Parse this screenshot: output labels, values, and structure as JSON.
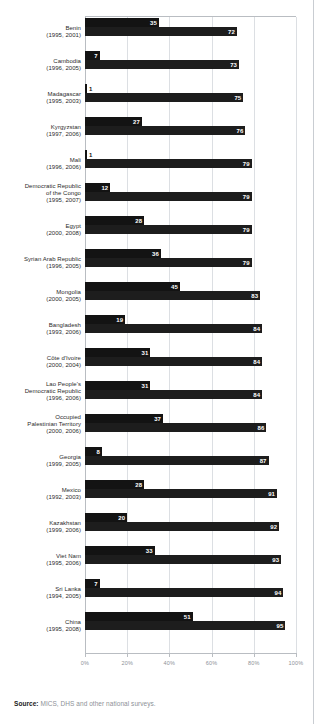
{
  "axis": {
    "ticks": [
      "0%",
      "20%",
      "40%",
      "60%",
      "80%",
      "100%"
    ],
    "tickvalues": [
      0,
      20,
      40,
      60,
      80,
      100
    ]
  },
  "source": {
    "label": "Source:",
    "text": "MICS, DHS and other national surveys."
  },
  "chart_data": {
    "type": "bar",
    "orientation": "horizontal",
    "title": "",
    "xlabel": "",
    "ylabel": "",
    "xlim": [
      0,
      100
    ],
    "grid": true,
    "legend": "none",
    "categories": [
      "Benin",
      "Cambodia",
      "Madagascar",
      "Kyrgyzstan",
      "Mali",
      "Democratic Republic of the Congo",
      "Egypt",
      "Syrian Arab Republic",
      "Mongolia",
      "Bangladesh",
      "Côte d'Ivoire",
      "Lao People's Democratic Republic",
      "Occupied Palestinian Territory",
      "Georgia",
      "Mexico",
      "Kazakhstan",
      "Viet Nam",
      "Sri Lanka",
      "China"
    ],
    "rows": [
      {
        "name": "Benin",
        "name_lines": [
          "Benin"
        ],
        "years": "(1995, 2001)",
        "earlier": 35,
        "later": 72
      },
      {
        "name": "Cambodia",
        "name_lines": [
          "Cambodia"
        ],
        "years": "(1996, 2005)",
        "earlier": 7,
        "later": 73
      },
      {
        "name": "Madagascar",
        "name_lines": [
          "Madagascar"
        ],
        "years": "(1995, 2003)",
        "earlier": 1,
        "later": 75
      },
      {
        "name": "Kyrgyzstan",
        "name_lines": [
          "Kyrgyzstan"
        ],
        "years": "(1997, 2006)",
        "earlier": 27,
        "later": 76
      },
      {
        "name": "Mali",
        "name_lines": [
          "Mali"
        ],
        "years": "(1996, 2006)",
        "earlier": 1,
        "later": 79
      },
      {
        "name": "Democratic Republic of the Congo",
        "name_lines": [
          "Democratic Republic",
          "of the Congo"
        ],
        "years": "(1995, 2007)",
        "earlier": 12,
        "later": 79
      },
      {
        "name": "Egypt",
        "name_lines": [
          "Egypt"
        ],
        "years": "(2000, 2008)",
        "earlier": 28,
        "later": 79
      },
      {
        "name": "Syrian Arab Republic",
        "name_lines": [
          "Syrian Arab Republic"
        ],
        "years": "(1996, 2005)",
        "earlier": 36,
        "later": 79
      },
      {
        "name": "Mongolia",
        "name_lines": [
          "Mongolia"
        ],
        "years": "(2000, 2005)",
        "earlier": 45,
        "later": 83
      },
      {
        "name": "Bangladesh",
        "name_lines": [
          "Bangladesh"
        ],
        "years": "(1993, 2006)",
        "earlier": 19,
        "later": 84
      },
      {
        "name": "Côte d'Ivoire",
        "name_lines": [
          "Côte d'Ivoire"
        ],
        "years": "(2000, 2004)",
        "earlier": 31,
        "later": 84
      },
      {
        "name": "Lao People's Democratic Republic",
        "name_lines": [
          "Lao People's",
          "Democratic Republic"
        ],
        "years": "(1996, 2006)",
        "earlier": 31,
        "later": 84
      },
      {
        "name": "Occupied Palestinian Territory",
        "name_lines": [
          "Occupied",
          "Palestinian Territory"
        ],
        "years": "(2000, 2006)",
        "earlier": 37,
        "later": 86
      },
      {
        "name": "Georgia",
        "name_lines": [
          "Georgia"
        ],
        "years": "(1999, 2005)",
        "earlier": 8,
        "later": 87
      },
      {
        "name": "Mexico",
        "name_lines": [
          "Mexico"
        ],
        "years": "(1992, 2003)",
        "earlier": 28,
        "later": 91
      },
      {
        "name": "Kazakhstan",
        "name_lines": [
          "Kazakhstan"
        ],
        "years": "(1999, 2006)",
        "earlier": 20,
        "later": 92
      },
      {
        "name": "Viet Nam",
        "name_lines": [
          "Viet Nam"
        ],
        "years": "(1995, 2006)",
        "earlier": 33,
        "later": 93
      },
      {
        "name": "Sri Lanka",
        "name_lines": [
          "Sri Lanka"
        ],
        "years": "(1994, 2005)",
        "earlier": 7,
        "later": 94
      },
      {
        "name": "China",
        "name_lines": [
          "China"
        ],
        "years": "(1995, 2008)",
        "earlier": 51,
        "later": 95
      }
    ],
    "series": [
      {
        "name": "earlier",
        "values": [
          35,
          7,
          1,
          27,
          1,
          12,
          28,
          36,
          45,
          19,
          31,
          31,
          37,
          8,
          28,
          20,
          33,
          7,
          51
        ]
      },
      {
        "name": "later",
        "values": [
          72,
          73,
          75,
          76,
          79,
          79,
          79,
          79,
          83,
          84,
          84,
          84,
          86,
          87,
          91,
          92,
          93,
          94,
          95
        ]
      }
    ],
    "colors": {
      "earlier": "#131313",
      "later": "#1d1d1d",
      "grid": "#dcdfe3",
      "axis": "#b9bdc2"
    }
  }
}
